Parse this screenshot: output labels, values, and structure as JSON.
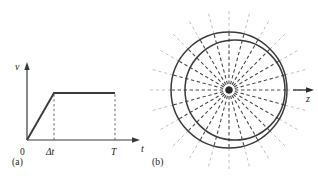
{
  "figure": {
    "panels": [
      {
        "caption": "(a)",
        "type": "velocity-time-profile",
        "axes": {
          "y_label": "v",
          "x_label": "t",
          "origin_label": "0"
        },
        "x_ticks": [
          {
            "label": "Δt",
            "italic": true
          },
          {
            "label": "T",
            "italic": true
          }
        ],
        "description": "Trapezoidal velocity profile: linear ramp from 0 to plateau over Δt, constant plateau until T."
      },
      {
        "caption": "(b)",
        "type": "radial-spoke-diagram",
        "axis_label": "z",
        "spoke_count": 24,
        "circle_count": 2,
        "description": "Concentric solid circles with dashed radial spokes converging at a central point; horizontal arrow labelled z points right."
      }
    ]
  },
  "chart_data": {
    "type": "line",
    "title": "",
    "xlabel": "t",
    "ylabel": "v",
    "xlim": [
      0,
      1.18
    ],
    "ylim": [
      0,
      1.22
    ],
    "grid": false,
    "legend": null,
    "x_tick_values": [
      0,
      0.3,
      0.92
    ],
    "x_tick_labels": [
      "0",
      "Δt",
      "T"
    ],
    "y_tick_values": [],
    "y_tick_labels": [],
    "series": [
      {
        "name": "velocity",
        "x": [
          0,
          0.3,
          0.92
        ],
        "values": [
          0,
          1.0,
          1.0
        ]
      }
    ],
    "annotations": [
      {
        "text": "Δt",
        "x": 0.3,
        "y": 0,
        "kind": "x-tick"
      },
      {
        "text": "T",
        "x": 0.92,
        "y": 0,
        "kind": "x-tick"
      },
      {
        "text": "0",
        "x": 0,
        "y": 0,
        "kind": "origin"
      }
    ],
    "dropline_x": [
      0.3,
      0.92
    ]
  },
  "colors": {
    "stroke": "#3a3a3a",
    "dash_inner": "#4a4a4a",
    "dash_outer": "#b9b9b9",
    "text": "#1a1a1a",
    "background": "#ffffff"
  }
}
